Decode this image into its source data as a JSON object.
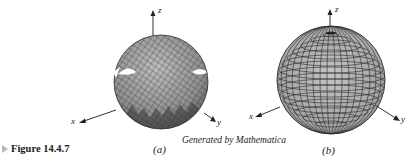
{
  "figure": {
    "label": "Figure 14.4.7",
    "credit": "Generated by Mathematica",
    "panels": [
      {
        "id": "a",
        "caption": "(a)",
        "description": "Sphere surface rendered with diagonal mesh, with jagged gaps near equator",
        "axes": {
          "x": "x",
          "y": "y",
          "z": "z"
        }
      },
      {
        "id": "b",
        "caption": "(b)",
        "description": "Smooth sphere with latitude/longitude grid",
        "axes": {
          "x": "x",
          "y": "y",
          "z": "z"
        }
      }
    ]
  },
  "colors": {
    "surface": "#9a9a9a",
    "mesh": "#2a2a2a",
    "axis": "#333333",
    "marker": "#b9b9b9"
  }
}
